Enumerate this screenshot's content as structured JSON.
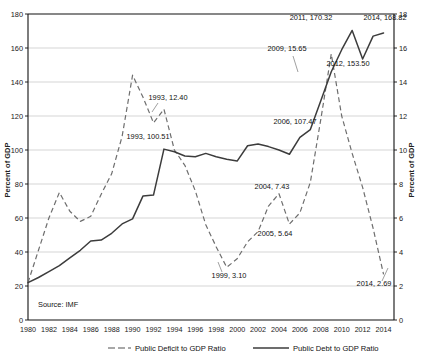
{
  "chart_data": {
    "type": "line",
    "title": "",
    "xlabel": "",
    "ylabel": "Percent of GDP",
    "y2label": "Percent of GDP",
    "source_note": "Source: IMF",
    "grid": true,
    "legend_position": "bottom",
    "x": [
      1980,
      1981,
      1982,
      1983,
      1984,
      1985,
      1986,
      1987,
      1988,
      1989,
      1990,
      1991,
      1992,
      1993,
      1994,
      1995,
      1996,
      1997,
      1998,
      1999,
      2000,
      2001,
      2002,
      2003,
      2004,
      2005,
      2006,
      2007,
      2008,
      2009,
      2010,
      2011,
      2012,
      2013,
      2014
    ],
    "xlim": [
      1980,
      2015
    ],
    "xticks": [
      1980,
      1982,
      1984,
      1986,
      1988,
      1990,
      1992,
      1994,
      1996,
      1998,
      2000,
      2002,
      2004,
      2006,
      2008,
      2010,
      2012,
      2014
    ],
    "xticklabels": [
      "1980",
      "1982",
      "1984",
      "1986",
      "1988",
      "1990",
      "1992",
      "1994",
      "1996",
      "1998",
      "2000",
      "2002",
      "2004",
      "2006",
      "2008",
      "2010",
      "2012",
      "2014"
    ],
    "ylim": [
      0,
      180
    ],
    "yticks": [
      0,
      20,
      40,
      60,
      80,
      100,
      120,
      140,
      160,
      180
    ],
    "yticklabels": [
      "0",
      "20",
      "40",
      "60",
      "80",
      "100",
      "120",
      "140",
      "160",
      "180"
    ],
    "y2lim": [
      0,
      18
    ],
    "y2ticks": [
      0,
      2,
      4,
      6,
      8,
      10,
      12,
      14,
      16,
      18
    ],
    "y2ticklabels": [
      "0",
      "2",
      "4",
      "6",
      "8",
      "10",
      "12",
      "14",
      "16",
      "18"
    ],
    "series": [
      {
        "name": "Public Deficit to GDP Ratio",
        "axis": "right",
        "style": "dashed",
        "color": "#6e6e6e",
        "values": [
          2.2,
          4.1,
          6.0,
          7.5,
          6.4,
          5.8,
          6.1,
          7.4,
          8.6,
          10.8,
          14.4,
          13.1,
          11.6,
          12.4,
          10.0,
          9.1,
          7.6,
          5.6,
          4.3,
          3.1,
          3.6,
          4.6,
          5.2,
          6.7,
          7.43,
          5.64,
          6.3,
          8.1,
          11.8,
          15.65,
          12.0,
          9.8,
          7.8,
          5.4,
          2.69
        ]
      },
      {
        "name": "Public Debt to GDP Ratio",
        "axis": "left",
        "style": "solid",
        "color": "#3c3c3c",
        "values": [
          22.0,
          25.0,
          28.5,
          32.0,
          36.5,
          41.0,
          46.5,
          47.0,
          51.0,
          56.5,
          59.5,
          73.0,
          73.5,
          100.51,
          99.0,
          96.5,
          96.0,
          98.0,
          96.0,
          94.5,
          93.5,
          102.5,
          103.5,
          102.0,
          100.0,
          97.5,
          107.47,
          112.0,
          129.0,
          146.0,
          159.0,
          170.32,
          153.5,
          167.0,
          168.82
        ]
      }
    ],
    "annotations": [
      {
        "label": "2011, 170.32",
        "x": 2011,
        "value": 170.32,
        "series": "Public Debt to GDP Ratio",
        "tx": 311,
        "ty": 20,
        "anchor": "middle",
        "leader": null
      },
      {
        "label": "2014, 168.82",
        "x": 2014,
        "value": 168.82,
        "series": "Public Debt to GDP Ratio",
        "tx": 385,
        "ty": 20,
        "anchor": "middle",
        "leader": null
      },
      {
        "label": "2009, 15.65",
        "x": 2009,
        "value": 15.65,
        "series": "Public Deficit to GDP Ratio",
        "tx": 287,
        "ty": 51,
        "anchor": "middle",
        "leader": {
          "x1": 293,
          "y1": 56,
          "x2": 298,
          "y2": 72
        }
      },
      {
        "label": "2012, 153.50",
        "x": 2012,
        "value": 153.5,
        "series": "Public Debt to GDP Ratio",
        "tx": 348,
        "ty": 66,
        "anchor": "middle",
        "leader": null
      },
      {
        "label": "1993, 12.40",
        "x": 1993,
        "value": 12.4,
        "series": "Public Deficit to GDP Ratio",
        "tx": 168,
        "ty": 100,
        "anchor": "middle",
        "leader": {
          "x1": 158,
          "y1": 103,
          "x2": 152,
          "y2": 112
        }
      },
      {
        "label": "2006, 107.47",
        "x": 2006,
        "value": 107.47,
        "series": "Public Debt to GDP Ratio",
        "tx": 295,
        "ty": 124,
        "anchor": "middle",
        "leader": null
      },
      {
        "label": "1993, 100.51",
        "x": 1993,
        "value": 100.51,
        "series": "Public Debt to GDP Ratio",
        "tx": 148,
        "ty": 139,
        "anchor": "middle",
        "leader": null
      },
      {
        "label": "2004, 7.43",
        "x": 2004,
        "value": 7.43,
        "series": "Public Deficit to GDP Ratio",
        "tx": 272,
        "ty": 189,
        "anchor": "middle",
        "leader": null
      },
      {
        "label": "2005, 5.64",
        "x": 2005,
        "value": 5.64,
        "series": "Public Deficit to GDP Ratio",
        "tx": 275,
        "ty": 236,
        "anchor": "middle",
        "leader": null
      },
      {
        "label": "1999, 3.10",
        "x": 1999,
        "value": 3.1,
        "series": "Public Deficit to GDP Ratio",
        "tx": 229,
        "ty": 278,
        "anchor": "middle",
        "leader": {
          "x1": 222,
          "y1": 272,
          "x2": 218,
          "y2": 262
        }
      },
      {
        "label": "2014, 2.69",
        "x": 2014,
        "value": 2.69,
        "series": "Public Deficit to GDP Ratio",
        "tx": 374,
        "ty": 286,
        "anchor": "middle",
        "leader": {
          "x1": 382,
          "y1": 281,
          "x2": 388,
          "y2": 268
        }
      }
    ]
  },
  "legend": {
    "items": [
      {
        "label": "Public Deficit to GDP Ratio",
        "style": "dashed",
        "color": "#6e6e6e"
      },
      {
        "label": "Public Debt to GDP Ratio",
        "style": "solid",
        "color": "#3c3c3c"
      }
    ]
  }
}
